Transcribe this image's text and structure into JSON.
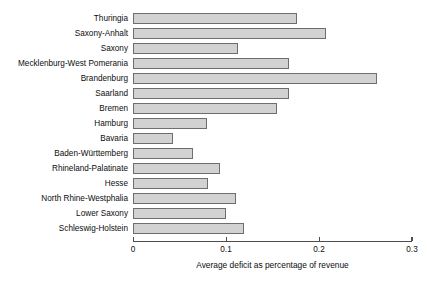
{
  "chart_data": {
    "type": "bar",
    "orientation": "horizontal",
    "title": "",
    "xlabel": "Average deficit as percentage of revenue",
    "ylabel": "",
    "xlim": [
      0,
      0.3
    ],
    "xticks": [
      "0",
      "0.1",
      "0.2",
      "0.3"
    ],
    "xtick_values": [
      0,
      0.1,
      0.2,
      0.3
    ],
    "grid": false,
    "legend": false,
    "bar_fill_color": "#d2d2d2",
    "bar_border_color": "#6e6e6e",
    "axis_color": "#4d4d4d",
    "background_color": "#ffffff",
    "categories": [
      "Thuringia",
      "Saxony-Anhalt",
      "Saxony",
      "Mecklenburg-West Pomerania",
      "Brandenburg",
      "Saarland",
      "Bremen",
      "Hamburg",
      "Bavaria",
      "Baden-Württemberg",
      "Rhineland-Palatinate",
      "Hesse",
      "North Rhine-Westphalia",
      "Lower Saxony",
      "Schleswig-Holstein"
    ],
    "values": [
      0.176,
      0.207,
      0.113,
      0.168,
      0.262,
      0.168,
      0.155,
      0.08,
      0.043,
      0.064,
      0.094,
      0.081,
      0.111,
      0.1,
      0.119
    ]
  }
}
